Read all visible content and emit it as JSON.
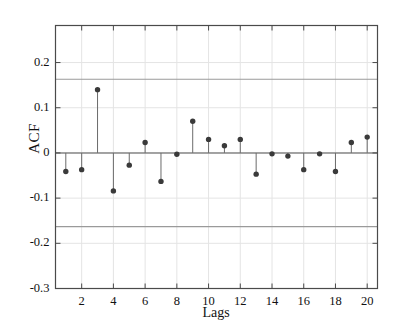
{
  "chart_data": {
    "type": "scatter",
    "subtype": "stem-acf",
    "title": "",
    "xlabel": "Lags",
    "ylabel": "ACF",
    "x": [
      1,
      2,
      3,
      4,
      5,
      6,
      7,
      8,
      9,
      10,
      11,
      12,
      13,
      14,
      15,
      16,
      17,
      18,
      19,
      20
    ],
    "values": [
      -0.041,
      -0.037,
      0.14,
      -0.084,
      -0.027,
      0.023,
      -0.063,
      -0.003,
      0.07,
      0.03,
      0.016,
      0.03,
      -0.047,
      -0.002,
      -0.007,
      -0.037,
      -0.002,
      -0.041,
      0.023,
      0.035
    ],
    "series": [
      {
        "name": "ACF",
        "values": [
          -0.041,
          -0.037,
          0.14,
          -0.084,
          -0.027,
          0.023,
          -0.063,
          -0.003,
          0.07,
          0.03,
          0.016,
          0.03,
          -0.047,
          -0.002,
          -0.007,
          -0.037,
          -0.002,
          -0.041,
          0.023,
          0.035
        ]
      }
    ],
    "xlim": [
      0.35,
      20.65
    ],
    "ylim": [
      -0.3,
      0.282
    ],
    "xticks": [
      2,
      4,
      6,
      8,
      10,
      12,
      14,
      16,
      18,
      20
    ],
    "xtick_labels": [
      "2",
      "4",
      "6",
      "8",
      "10",
      "12",
      "14",
      "16",
      "18",
      "20"
    ],
    "yticks": [
      0.2,
      0.1,
      0,
      -0.1,
      -0.2,
      -0.3
    ],
    "ytick_labels": [
      "0.2",
      "0.1",
      "0",
      "-0.1",
      "-0.2",
      "-0.3"
    ],
    "grid": true,
    "legend": "none",
    "confidence_bounds": {
      "upper": 0.163,
      "lower": -0.163,
      "label": "95% confidence bounds"
    },
    "baseline": 0,
    "colors": {
      "marker": "#3a3a3a",
      "stem": "#6b6b6b",
      "baseline": "#555555",
      "confidence": "#9a9a9a",
      "grid": "#e4e4e4",
      "axis": "#4a4a4a",
      "background": "#ffffff"
    }
  }
}
